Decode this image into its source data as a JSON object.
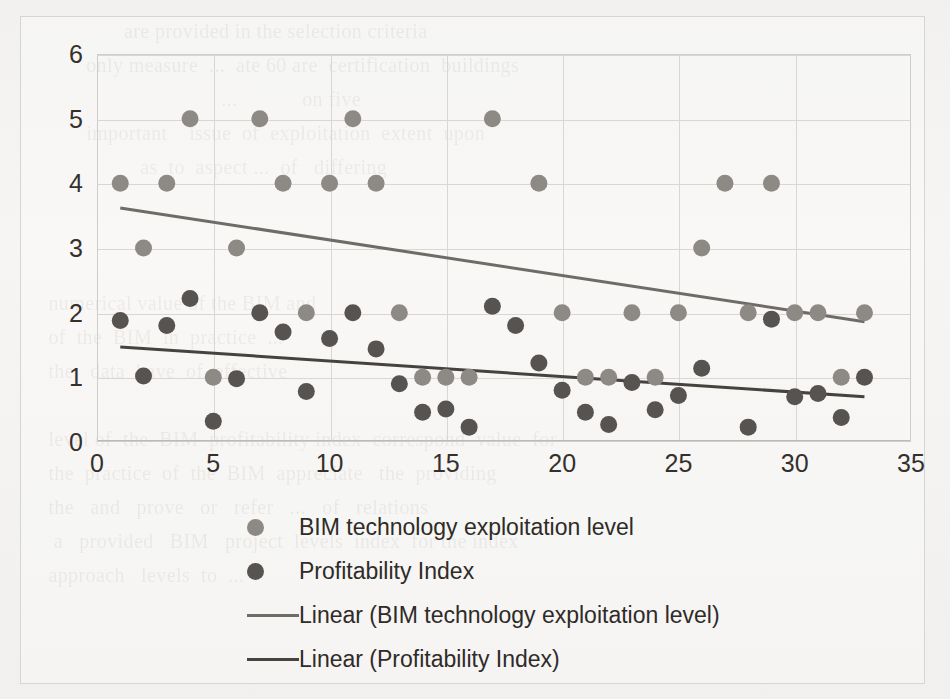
{
  "chart_data": {
    "type": "scatter",
    "title": "",
    "xlabel": "",
    "ylabel": "",
    "xlim": [
      0,
      35
    ],
    "ylim": [
      0,
      6
    ],
    "x_ticks": [
      0,
      5,
      10,
      15,
      20,
      25,
      30,
      35
    ],
    "y_ticks": [
      0,
      1,
      2,
      3,
      4,
      5,
      6
    ],
    "grid": true,
    "legend_position": "bottom",
    "series": [
      {
        "name": "BIM technology exploitation level",
        "type": "scatter",
        "color": "#8d8a86",
        "points": [
          {
            "x": 1,
            "y": 4
          },
          {
            "x": 2,
            "y": 3
          },
          {
            "x": 3,
            "y": 4
          },
          {
            "x": 4,
            "y": 5
          },
          {
            "x": 5,
            "y": 1
          },
          {
            "x": 6,
            "y": 3
          },
          {
            "x": 7,
            "y": 5
          },
          {
            "x": 8,
            "y": 4
          },
          {
            "x": 9,
            "y": 2
          },
          {
            "x": 10,
            "y": 4
          },
          {
            "x": 11,
            "y": 5
          },
          {
            "x": 12,
            "y": 4
          },
          {
            "x": 13,
            "y": 2
          },
          {
            "x": 14,
            "y": 1
          },
          {
            "x": 15,
            "y": 1
          },
          {
            "x": 16,
            "y": 1
          },
          {
            "x": 17,
            "y": 5
          },
          {
            "x": 19,
            "y": 4
          },
          {
            "x": 20,
            "y": 2
          },
          {
            "x": 21,
            "y": 1
          },
          {
            "x": 22,
            "y": 1
          },
          {
            "x": 23,
            "y": 2
          },
          {
            "x": 24,
            "y": 1
          },
          {
            "x": 25,
            "y": 2
          },
          {
            "x": 26,
            "y": 3
          },
          {
            "x": 27,
            "y": 4
          },
          {
            "x": 28,
            "y": 2
          },
          {
            "x": 29,
            "y": 4
          },
          {
            "x": 30,
            "y": 2
          },
          {
            "x": 31,
            "y": 2
          },
          {
            "x": 32,
            "y": 1
          },
          {
            "x": 33,
            "y": 2
          }
        ]
      },
      {
        "name": "Profitability Index",
        "type": "scatter",
        "color": "#565350",
        "points": [
          {
            "x": 1,
            "y": 1.88
          },
          {
            "x": 2,
            "y": 1.02
          },
          {
            "x": 3,
            "y": 1.8
          },
          {
            "x": 4,
            "y": 2.22
          },
          {
            "x": 5,
            "y": 0.32
          },
          {
            "x": 6,
            "y": 0.98
          },
          {
            "x": 7,
            "y": 2.0
          },
          {
            "x": 8,
            "y": 1.7
          },
          {
            "x": 9,
            "y": 0.78
          },
          {
            "x": 10,
            "y": 1.6
          },
          {
            "x": 11,
            "y": 2.0
          },
          {
            "x": 12,
            "y": 1.44
          },
          {
            "x": 13,
            "y": 0.9
          },
          {
            "x": 14,
            "y": 0.46
          },
          {
            "x": 15,
            "y": 0.51
          },
          {
            "x": 16,
            "y": 0.23
          },
          {
            "x": 17,
            "y": 2.1
          },
          {
            "x": 18,
            "y": 1.8
          },
          {
            "x": 19,
            "y": 1.22
          },
          {
            "x": 20,
            "y": 0.8
          },
          {
            "x": 21,
            "y": 0.46
          },
          {
            "x": 22,
            "y": 0.27
          },
          {
            "x": 23,
            "y": 0.92
          },
          {
            "x": 24,
            "y": 0.5
          },
          {
            "x": 25,
            "y": 0.72
          },
          {
            "x": 26,
            "y": 1.14
          },
          {
            "x": 28,
            "y": 0.23
          },
          {
            "x": 29,
            "y": 1.9
          },
          {
            "x": 30,
            "y": 0.7
          },
          {
            "x": 31,
            "y": 0.75
          },
          {
            "x": 32,
            "y": 0.38
          },
          {
            "x": 33,
            "y": 1.0
          }
        ]
      },
      {
        "name": "Linear (BIM technology exploitation level)",
        "type": "line",
        "color": "#6f6c68",
        "x_start": 1,
        "y_start": 3.62,
        "x_end": 33,
        "y_end": 1.86
      },
      {
        "name": "Linear (Profitability Index)",
        "type": "line",
        "color": "#46433f",
        "x_start": 1,
        "y_start": 1.47,
        "x_end": 33,
        "y_end": 0.7
      }
    ]
  },
  "chart": {
    "y_tick_labels": [
      "0",
      "1",
      "2",
      "3",
      "4",
      "5",
      "6"
    ],
    "x_tick_labels": [
      "0",
      "5",
      "10",
      "15",
      "20",
      "25",
      "30",
      "35"
    ]
  },
  "legend": {
    "items": [
      {
        "label": "BIM technology exploitation level",
        "marker": "dot",
        "color": "#8d8a86"
      },
      {
        "label": "Profitability Index",
        "marker": "dot",
        "color": "#565350"
      },
      {
        "label": "Linear (BIM technology exploitation level)",
        "marker": "line",
        "color": "#6f6c68"
      },
      {
        "label": "Linear (Profitability Index)",
        "marker": "line",
        "color": "#46433f"
      }
    ]
  },
  "background": {
    "ghost_text_lines": [
      "                    are provided in the selection criteria",
      "             only measure  ...  ate 60 are  certification  buildings",
      "                                      ...            on five",
      "             important    issue  of  exploitation  extent  upon",
      "                       as  to  aspect ...  of   differing",
      "",
      "",
      "",
      "      numerical value of the BIM and",
      "      of  the  BIM  in  practice  ...",
      "      the   data  have  of  effective",
      "",
      "      level of  the  BIM  profitability index  correspond  value  for",
      "      the  practice  of  the  BIM  appreciate   the  providing",
      "      the   and   prove   or   refer   ...   of   relations",
      "       a   provided   BIM   project  levels  index  for the index",
      "      approach   levels  to  ..."
    ]
  }
}
